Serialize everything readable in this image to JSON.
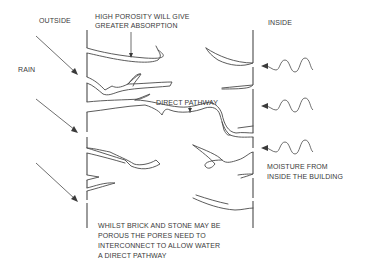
{
  "diagram": {
    "labels": {
      "outside": "OUTSIDE",
      "inside": "INSIDE",
      "rain": "RAIN",
      "high_porosity_line1": "HIGH POROSITY WILL GIVE",
      "high_porosity_line2": "GREATER ABSORPTION",
      "direct_pathway": "DIRECT PATHWAY",
      "moisture_line1": "MOISTURE FROM",
      "moisture_line2": "INSIDE THE BUILDING",
      "note_line1": "WHILST BRICK AND STONE MAY BE",
      "note_line2": "POROUS THE PORES NEED TO",
      "note_line3": "INTERCONNECT TO ALLOW WATER",
      "note_line4": "A DIRECT PATHWAY"
    },
    "elements": {
      "rain_arrows": 3,
      "moisture_wave_arrows": 3,
      "wall_faces": [
        "outside-face",
        "inside-face"
      ],
      "pores": "irregular channels through wall; one interconnecting to form a direct pathway"
    },
    "colors": {
      "line": "#4a4a4a",
      "text": "#3a3a3a",
      "background": "#ffffff"
    }
  }
}
